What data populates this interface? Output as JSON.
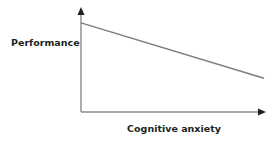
{
  "chart_data": {
    "type": "line",
    "title": "",
    "xlabel": "Cognitive anxiety",
    "ylabel": "Performance",
    "xlim": [
      0,
      1
    ],
    "ylim": [
      0,
      1
    ],
    "grid": false,
    "ticks": false,
    "legend": "none",
    "series": [
      {
        "name": "Performance vs cognitive anxiety",
        "x": [
          0,
          1
        ],
        "y": [
          0.9,
          0.34
        ]
      }
    ],
    "colors": {
      "axis": "#8a8a8a",
      "arrowhead": "#231f20",
      "line": "#7d7d7d",
      "text": "#231f20"
    }
  }
}
